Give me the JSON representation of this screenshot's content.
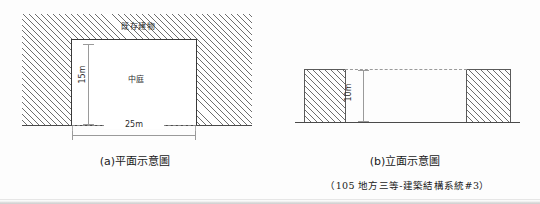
{
  "figure_a": {
    "caption": "(a)平面示意圖",
    "region_label": "既存建物",
    "inner_label": "中庭",
    "dim_vertical": "15m",
    "dim_horizontal": "25m"
  },
  "figure_b": {
    "caption": "(b)立面示意圖",
    "dim_vertical": "10m"
  },
  "source_note": "（105 地方三等-建築結構系統#3）",
  "colors": {
    "hatch_line": "#6e6e6e",
    "outline": "#3a3a3a",
    "dimension": "#9a9a9a",
    "ground": "#4a4a4a",
    "text": "#1a1a1a",
    "paper": "#fdfdfd"
  }
}
